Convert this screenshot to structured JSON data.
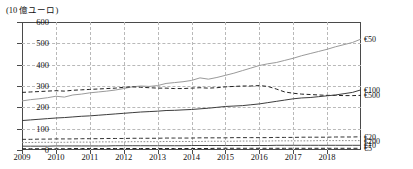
{
  "axes": {
    "unit_label": "(10 億ユーロ)",
    "y_ticks": [
      "600",
      "500",
      "400",
      "300",
      "200",
      "100",
      "0"
    ],
    "x_ticks": [
      "2009",
      "2010",
      "2011",
      "2012",
      "2013",
      "2014",
      "2015",
      "2016",
      "2017",
      "2018"
    ]
  },
  "right_labels": [
    {
      "text": "€50",
      "value": 520
    },
    {
      "text": "€100",
      "value": 282
    },
    {
      "text": "€500",
      "value": 256
    },
    {
      "text": "€20",
      "value": 62
    },
    {
      "text": "€200",
      "value": 44
    },
    {
      "text": "€10",
      "value": 22
    },
    {
      "text": "€5",
      "value": 8
    }
  ],
  "colors": {
    "frame": "#4a4a4a",
    "grid": "#b9b9b9",
    "series_50": "#9a9a9a",
    "series_100": "#3d3d3d",
    "series_500": "#222222",
    "series_20": "#333333",
    "series_200": "#8a8a8a",
    "series_10": "#444444",
    "series_5": "#222222"
  },
  "chart_data": {
    "type": "line",
    "title": "",
    "subtitle": "",
    "xlabel": "",
    "ylabel": "(10 億ユーロ)",
    "ylim": [
      0,
      600
    ],
    "xlim": [
      2009,
      2019
    ],
    "grid": true,
    "legend_position": "right-axis-labels",
    "y_tick_values": [
      0,
      100,
      200,
      300,
      400,
      500,
      600
    ],
    "x_tick_values": [
      2009,
      2010,
      2011,
      2012,
      2013,
      2014,
      2015,
      2016,
      2017,
      2018
    ],
    "x_note": "quarterly points from 2009.0 to 2019.0",
    "x": [
      2009.0,
      2009.25,
      2009.5,
      2009.75,
      2010.0,
      2010.25,
      2010.5,
      2010.75,
      2011.0,
      2011.25,
      2011.5,
      2011.75,
      2012.0,
      2012.25,
      2012.5,
      2012.75,
      2013.0,
      2013.25,
      2013.5,
      2013.75,
      2014.0,
      2014.25,
      2014.5,
      2014.75,
      2015.0,
      2015.25,
      2015.5,
      2015.75,
      2016.0,
      2016.25,
      2016.5,
      2016.75,
      2017.0,
      2017.25,
      2017.5,
      2017.75,
      2018.0,
      2018.25,
      2018.5,
      2018.75,
      2019.0
    ],
    "series": [
      {
        "name": "€50",
        "style": "solid",
        "color": "#9a9a9a",
        "values": [
          230,
          236,
          240,
          245,
          252,
          248,
          258,
          262,
          268,
          272,
          276,
          281,
          288,
          296,
          300,
          298,
          302,
          312,
          316,
          320,
          326,
          338,
          332,
          340,
          350,
          360,
          372,
          384,
          396,
          404,
          410,
          420,
          430,
          442,
          452,
          462,
          472,
          484,
          494,
          504,
          520
        ]
      },
      {
        "name": "€500",
        "style": "dashed",
        "color": "#222222",
        "values": [
          270,
          272,
          274,
          276,
          278,
          276,
          280,
          282,
          284,
          286,
          288,
          290,
          294,
          296,
          294,
          292,
          290,
          290,
          288,
          288,
          290,
          292,
          290,
          292,
          296,
          298,
          300,
          300,
          302,
          298,
          286,
          272,
          266,
          262,
          260,
          258,
          256,
          256,
          255,
          255,
          256
        ]
      },
      {
        "name": "€100",
        "style": "solid",
        "color": "#3d3d3d",
        "values": [
          138,
          141,
          144,
          147,
          150,
          152,
          155,
          158,
          160,
          163,
          166,
          169,
          172,
          175,
          178,
          180,
          182,
          185,
          186,
          188,
          190,
          193,
          196,
          200,
          204,
          206,
          208,
          212,
          216,
          222,
          228,
          234,
          240,
          244,
          246,
          250,
          254,
          258,
          264,
          270,
          282
        ]
      },
      {
        "name": "€20",
        "style": "dashed",
        "color": "#333333",
        "values": [
          50,
          50,
          51,
          51,
          52,
          52,
          52,
          53,
          53,
          53,
          54,
          54,
          54,
          55,
          55,
          55,
          55,
          56,
          56,
          56,
          56,
          57,
          57,
          57,
          57,
          58,
          58,
          58,
          58,
          58,
          59,
          59,
          59,
          60,
          60,
          60,
          60,
          61,
          61,
          61,
          62
        ]
      },
      {
        "name": "€200",
        "style": "dotted",
        "color": "#8a8a8a",
        "values": [
          35,
          35,
          36,
          36,
          36,
          36,
          37,
          37,
          37,
          38,
          38,
          38,
          38,
          39,
          39,
          39,
          39,
          40,
          40,
          40,
          40,
          40,
          41,
          41,
          41,
          41,
          42,
          42,
          42,
          42,
          43,
          43,
          43,
          43,
          43,
          44,
          44,
          44,
          44,
          44,
          44
        ]
      },
      {
        "name": "€10",
        "style": "solid",
        "color": "#444444",
        "values": [
          18,
          18,
          18,
          18,
          19,
          19,
          19,
          19,
          19,
          19,
          19,
          20,
          20,
          20,
          20,
          20,
          20,
          20,
          20,
          20,
          21,
          21,
          21,
          21,
          21,
          21,
          21,
          21,
          21,
          21,
          22,
          22,
          22,
          22,
          22,
          22,
          22,
          22,
          22,
          22,
          22
        ]
      },
      {
        "name": "€5",
        "style": "dashed",
        "color": "#222222",
        "values": [
          6,
          6,
          6,
          6,
          6,
          6,
          7,
          7,
          7,
          7,
          7,
          7,
          7,
          7,
          7,
          7,
          7,
          7,
          7,
          7,
          7,
          7,
          7,
          8,
          8,
          8,
          8,
          8,
          8,
          8,
          8,
          8,
          8,
          8,
          8,
          8,
          8,
          8,
          8,
          8,
          8
        ]
      }
    ]
  }
}
